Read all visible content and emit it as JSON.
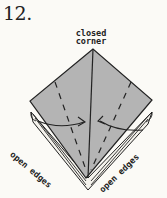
{
  "step": {
    "number": "12."
  },
  "labels": {
    "top_line1": "closed",
    "top_line2": "corner",
    "left": "open edges",
    "right": "open edges"
  },
  "colors": {
    "paper_fill": "#b4b4b4",
    "line": "#222222",
    "background": "#fbfaf6"
  }
}
